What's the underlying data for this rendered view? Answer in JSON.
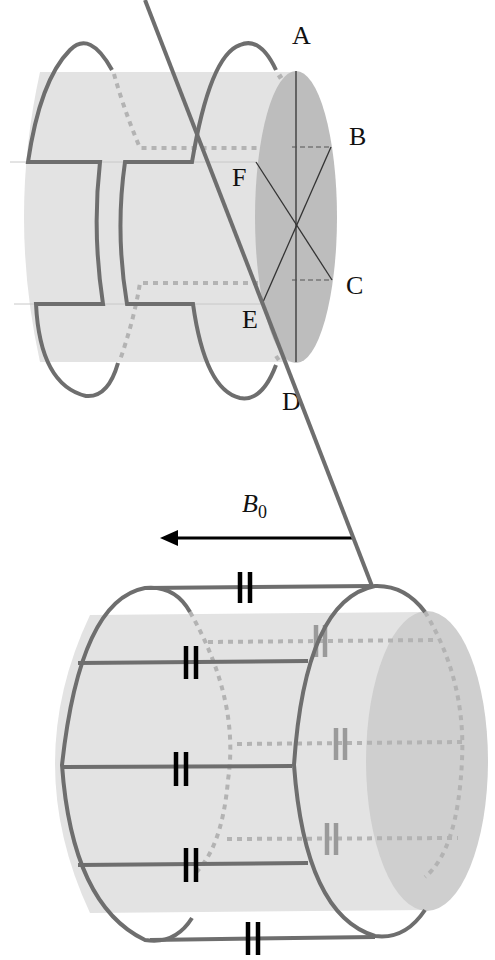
{
  "figure": {
    "top_diagram": {
      "description": "Saddle coil on cylinder with cross-section",
      "point_labels": [
        "A",
        "B",
        "C",
        "D",
        "E",
        "F"
      ]
    },
    "bottom_diagram": {
      "description": "Birdcage coil with capacitors on cylinder",
      "field_label": "B",
      "field_subscript": "0",
      "field_direction": "left"
    }
  },
  "colors": {
    "cylinder": "#e3e3e3",
    "end_face": "#bdbdbd",
    "coil": "#6e6e6e",
    "hidden_coil": "#b3b3b3",
    "capacitor": "#000000"
  }
}
